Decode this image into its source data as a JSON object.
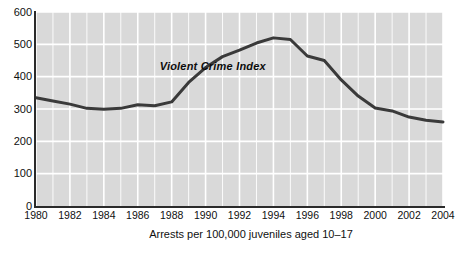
{
  "figure": {
    "caption": "Arrests per 100,000 juveniles aged 10–17",
    "footnote": ""
  },
  "chart_data": {
    "type": "line",
    "title": "",
    "subtitle": "",
    "xlabel": "Arrests per 100,000 juveniles aged 10–17",
    "ylabel": "",
    "annotations": [
      {
        "text": "Violent Crime Index",
        "x": 1987.3,
        "y": 432
      }
    ],
    "legend": [],
    "legend_position": "inline-annotation",
    "grid": true,
    "grid_x_every": 1,
    "grid_y_every": 100,
    "xlim": [
      1980,
      2004
    ],
    "ylim": [
      0,
      600
    ],
    "yticks": [
      0,
      100,
      200,
      300,
      400,
      500,
      600
    ],
    "ytick_labels": [
      "0",
      "100",
      "200",
      "300",
      "400",
      "500",
      "600"
    ],
    "xticks": [
      1980,
      1982,
      1984,
      1986,
      1988,
      1990,
      1992,
      1994,
      1996,
      1998,
      2000,
      2002,
      2004
    ],
    "xtick_labels": [
      "1980",
      "1982",
      "1984",
      "1986",
      "1988",
      "1990",
      "1992",
      "1994",
      "1996",
      "1998",
      "2000",
      "2002",
      "2004"
    ],
    "x": [
      1980,
      1981,
      1982,
      1983,
      1984,
      1985,
      1986,
      1987,
      1988,
      1989,
      1990,
      1991,
      1992,
      1993,
      1994,
      1995,
      1996,
      1997,
      1998,
      1999,
      2000,
      2001,
      2002,
      2003,
      2004
    ],
    "series": [
      {
        "name": "Violent Crime Index",
        "color": "#3a3a3a",
        "line_width": 3,
        "values": [
          335,
          325,
          315,
          302,
          299,
          302,
          313,
          310,
          322,
          382,
          428,
          462,
          482,
          504,
          520,
          515,
          464,
          450,
          390,
          340,
          303,
          294,
          275,
          265,
          260
        ]
      }
    ]
  },
  "colors": {
    "plot_background": "#d9d9d9",
    "gridline": "#ffffff",
    "axis": "#2b2b2b",
    "line": "#3a3a3a",
    "text": "#101010",
    "page_background": "#ffffff"
  }
}
